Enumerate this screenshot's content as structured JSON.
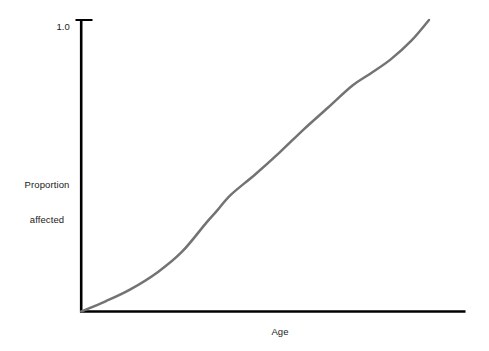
{
  "chart_data": {
    "type": "line",
    "title": "",
    "subtitle": "",
    "xlabel": "Age",
    "ylabel": "Proportion affected",
    "ylabel_lines": [
      "Proportion",
      "affected"
    ],
    "y_tick_labels": [
      "1.0"
    ],
    "y_tick_values": [
      1.0
    ],
    "x_tick_labels": [],
    "x_tick_values": [],
    "xlim": [
      0,
      1.1
    ],
    "ylim": [
      0,
      1.0
    ],
    "grid": false,
    "legend": false,
    "legend_position": "none",
    "annotations": [],
    "series": [
      {
        "name": "Proportion affected",
        "color": "#737373",
        "line_width": 2.5,
        "x": [
          0.0,
          0.07,
          0.14,
          0.22,
          0.29,
          0.36,
          0.39,
          0.43,
          0.5,
          0.57,
          0.64,
          0.71,
          0.78,
          0.83,
          0.89,
          0.95,
          1.0
        ],
        "y": [
          0.0,
          0.035,
          0.075,
          0.135,
          0.205,
          0.305,
          0.345,
          0.4,
          0.47,
          0.545,
          0.625,
          0.7,
          0.775,
          0.815,
          0.865,
          0.93,
          1.0
        ]
      }
    ],
    "shape_description": "monotonic sigmoid curve rising from origin to 1.0 with a slight shoulder near mid-range"
  },
  "axes": {
    "y_axis_color": "#000000",
    "x_axis_color": "#000000",
    "axis_line_width": 2.5,
    "tick_color": "#000000",
    "background": "#ffffff",
    "text_color": "#1a1a1a"
  }
}
